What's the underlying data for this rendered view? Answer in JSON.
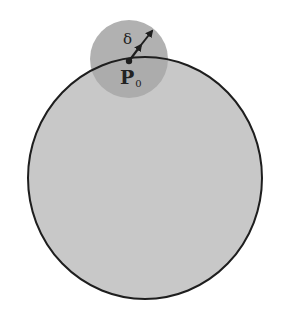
{
  "diagram": {
    "labels": {
      "delta": "δ",
      "point_main": "P",
      "point_sub": "0"
    },
    "colors": {
      "background": "#ffffff",
      "large_circle_fill": "#c8c8c8",
      "small_circle_fill": "#a9a9a9",
      "stroke": "#1e1e1e"
    },
    "shapes": {
      "large_circle": {
        "cx": 145,
        "cy": 178,
        "rx": 117,
        "ry": 121
      },
      "small_circle": {
        "cx": 129,
        "cy": 59,
        "r": 39
      },
      "point_p0": {
        "x": 129,
        "y": 61
      },
      "arrow": {
        "x1": 129,
        "y1": 61,
        "x2": 152,
        "y2": 31
      }
    }
  }
}
